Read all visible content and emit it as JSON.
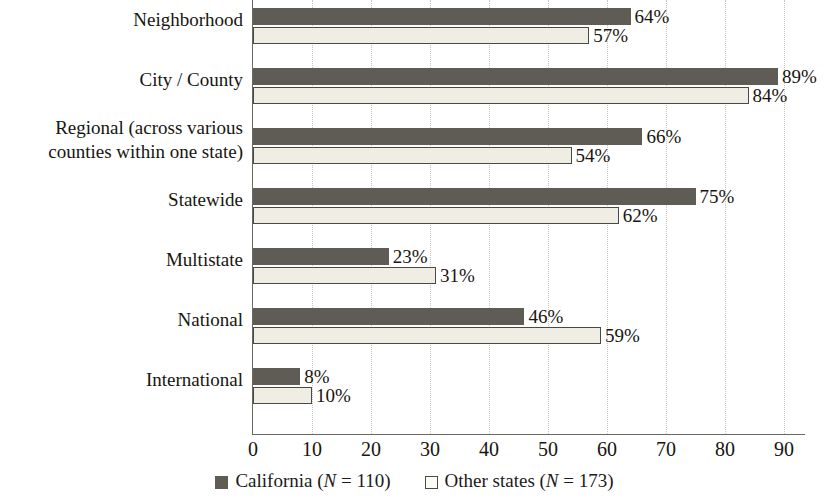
{
  "chart_data": {
    "type": "bar",
    "orientation": "horizontal",
    "title": "",
    "subtitle": "",
    "xlabel": "",
    "ylabel": "",
    "xlim": [
      0,
      93.7
    ],
    "xticks": [
      0,
      10,
      20,
      30,
      40,
      50,
      60,
      70,
      80,
      90
    ],
    "xticklabels": [
      "0",
      "10",
      "20",
      "30",
      "40",
      "50",
      "60",
      "70",
      "80",
      "90"
    ],
    "grid": "vertical-dotted",
    "legend_position": "bottom-center",
    "value_label_suffix": "%",
    "categories": [
      "Neighborhood",
      "City / County",
      "Regional (across various counties within one state)",
      "Statewide",
      "Multistate",
      "National",
      "International"
    ],
    "category_lines": [
      [
        "Neighborhood"
      ],
      [
        "City / County"
      ],
      [
        "Regional (across various",
        "counties within one state)"
      ],
      [
        "Statewide"
      ],
      [
        "Multistate"
      ],
      [
        "National"
      ],
      [
        "International"
      ]
    ],
    "series": [
      {
        "name": "California",
        "n": 110,
        "color": "#5f5c55",
        "values": [
          64,
          89,
          66,
          75,
          23,
          46,
          8
        ],
        "labels": [
          "64%",
          "89%",
          "66%",
          "75%",
          "23%",
          "46%",
          "8%"
        ]
      },
      {
        "name": "Other states",
        "n": 173,
        "color": "#efede4",
        "values": [
          57,
          84,
          54,
          62,
          31,
          59,
          10
        ],
        "labels": [
          "57%",
          "84%",
          "54%",
          "62%",
          "31%",
          "59%",
          "10%"
        ]
      }
    ]
  },
  "legend": {
    "items": [
      {
        "marker": "filled-square",
        "name": "California",
        "n_prefix": "(",
        "n_symbol": "N",
        "n_eq": " = ",
        "n_value": "110",
        "n_suffix": ")"
      },
      {
        "marker": "open-square",
        "name": "Other states",
        "n_prefix": "(",
        "n_symbol": "N",
        "n_eq": " = ",
        "n_value": "173",
        "n_suffix": ")"
      }
    ]
  },
  "colors": {
    "california_bar": "#5f5c55",
    "other_bar_fill": "#efede4",
    "other_bar_border": "#4b4943",
    "gridline": "#c9c6bd",
    "axis": "#6a6a64",
    "text": "#17150f",
    "background": "#ffffff"
  }
}
